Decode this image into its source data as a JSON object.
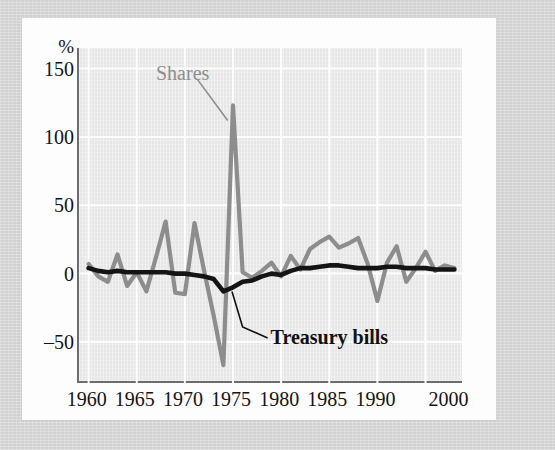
{
  "figure": {
    "y_unit_label": "%",
    "annotations": [
      {
        "name": "shares",
        "text": "Shares"
      },
      {
        "name": "treasury-bills",
        "text": "Treasury bills"
      }
    ]
  },
  "chart_data": {
    "type": "line",
    "title": "",
    "xlabel": "",
    "ylabel": "%",
    "xlim": [
      1959,
      1999
    ],
    "ylim": [
      -80,
      165
    ],
    "grid": true,
    "legend": "annotated-inline",
    "colors": {
      "shares": "#8d8d8d",
      "treasury_bills": "#141414",
      "plot_background": "#ebebeb",
      "gridline": "#fdfdfd",
      "axis": "#6d6d6d",
      "card_background": "#fdfdfd",
      "page_background": "#d7d7d7"
    },
    "xticks": [
      1960,
      1965,
      1970,
      1975,
      1980,
      1985,
      1990,
      2000
    ],
    "xtick_labels": [
      "1960",
      "1965",
      "1970",
      "1975",
      "1980",
      "1985",
      "1990",
      "2000"
    ],
    "yticks": [
      -50,
      0,
      50,
      100,
      150
    ],
    "ytick_labels": [
      "–50",
      "0",
      "50",
      "100",
      "150"
    ],
    "x": [
      1960,
      1961,
      1962,
      1963,
      1964,
      1965,
      1966,
      1967,
      1968,
      1969,
      1970,
      1971,
      1972,
      1973,
      1974,
      1975,
      1976,
      1977,
      1978,
      1979,
      1980,
      1981,
      1982,
      1983,
      1984,
      1985,
      1986,
      1987,
      1988,
      1989,
      1990,
      1991,
      1992,
      1993,
      1994,
      1995,
      1996,
      1997,
      1998
    ],
    "series": [
      {
        "name": "Shares",
        "color": "#8d8d8d",
        "values": [
          7,
          -2,
          -6,
          14,
          -9,
          1,
          -13,
          12,
          38,
          -14,
          -15,
          37,
          2,
          -31,
          -67,
          123,
          1,
          -3,
          2,
          8,
          -2,
          13,
          3,
          18,
          23,
          27,
          19,
          22,
          26,
          7,
          -20,
          8,
          20,
          -6,
          4,
          16,
          2,
          6,
          4
        ]
      },
      {
        "name": "Treasury bills",
        "color": "#141414",
        "values": [
          4,
          2,
          1,
          2,
          1,
          1,
          1,
          1,
          1,
          0,
          0,
          -1,
          -2,
          -4,
          -13,
          -10,
          -6,
          -5,
          -2,
          0,
          -1,
          2,
          4,
          4,
          5,
          6,
          6,
          5,
          4,
          4,
          4,
          5,
          5,
          4,
          4,
          4,
          3,
          3,
          3
        ]
      }
    ],
    "notes": {
      "peak": {
        "series": "Shares",
        "year": 1975,
        "value": 123
      },
      "trough": {
        "series": "Shares",
        "year": 1974,
        "value": -67
      },
      "tbill_trough": {
        "series": "Treasury bills",
        "year": 1974,
        "value": -13
      }
    }
  }
}
